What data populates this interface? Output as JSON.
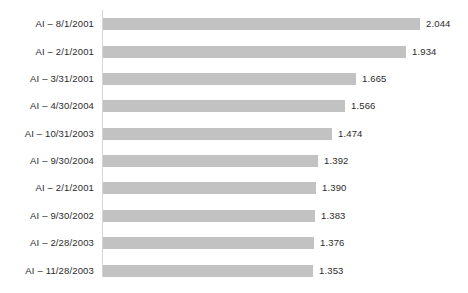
{
  "chart_data": {
    "type": "bar",
    "orientation": "horizontal",
    "title": "",
    "subtitle": "",
    "xlabel": "",
    "ylabel": "",
    "grid": false,
    "legend": null,
    "legend_position": "none",
    "bar_color": "#c2c2c2",
    "text_color": "#2b2b2b",
    "axis_color": "#d6d6d6",
    "axis_ticks": [],
    "xlim": [
      0,
      2.044
    ],
    "bar_baseline_value": 0.0,
    "categories": [
      "AI – 8/1/2001",
      "AI – 2/1/2001",
      "AI – 3/31/2001",
      "AI – 4/30/2004",
      "AI – 10/31/2003",
      "AI – 9/30/2004",
      "AI – 2/1/2001",
      "AI – 9/30/2002",
      "AI – 2/28/2003",
      "AI – 11/28/2003"
    ],
    "values": [
      2.044,
      1.934,
      1.665,
      1.566,
      1.474,
      1.392,
      1.39,
      1.383,
      1.376,
      1.353
    ],
    "value_labels": [
      "2.044",
      "1.934",
      "1.665",
      "1.566",
      "1.474",
      "1.392",
      "1.390",
      "1.383",
      "1.376",
      "1.353"
    ],
    "bars": [
      {
        "category": "AI – 8/1/2001",
        "value": 2.044,
        "label": "2.044",
        "bar_px": 317,
        "row_top_px": 18
      },
      {
        "category": "AI – 2/1/2001",
        "value": 1.934,
        "label": "1.934",
        "bar_px": 303,
        "row_top_px": 46
      },
      {
        "category": "AI – 3/31/2001",
        "value": 1.665,
        "label": "1.665",
        "bar_px": 253,
        "row_top_px": 73
      },
      {
        "category": "AI – 4/30/2004",
        "value": 1.566,
        "label": "1.566",
        "bar_px": 242,
        "row_top_px": 100
      },
      {
        "category": "AI – 10/31/2003",
        "value": 1.474,
        "label": "1.474",
        "bar_px": 229,
        "row_top_px": 128
      },
      {
        "category": "AI – 9/30/2004",
        "value": 1.392,
        "label": "1.392",
        "bar_px": 215,
        "row_top_px": 155
      },
      {
        "category": "AI – 2/1/2001",
        "value": 1.39,
        "label": "1.390",
        "bar_px": 213,
        "row_top_px": 182
      },
      {
        "category": "AI – 9/30/2002",
        "value": 1.383,
        "label": "1.383",
        "bar_px": 212,
        "row_top_px": 210
      },
      {
        "category": "AI – 2/28/2003",
        "value": 1.376,
        "label": "1.376",
        "bar_px": 211,
        "row_top_px": 237
      },
      {
        "category": "AI – 11/28/2003",
        "value": 1.353,
        "label": "1.353",
        "bar_px": 210,
        "row_top_px": 265
      }
    ]
  }
}
